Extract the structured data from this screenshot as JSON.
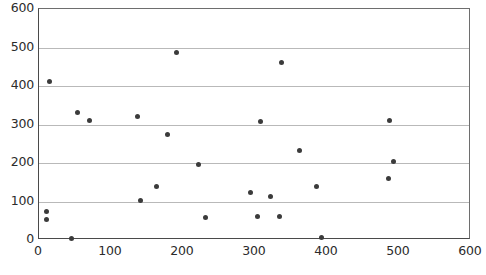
{
  "chart_data": {
    "type": "scatter",
    "title": "",
    "subtitle": "",
    "xlabel": "",
    "ylabel": "",
    "xlim": [
      0,
      600
    ],
    "ylim": [
      0,
      600
    ],
    "xticks": [
      0,
      100,
      200,
      300,
      400,
      500,
      600
    ],
    "yticks": [
      0,
      100,
      200,
      300,
      400,
      500,
      600
    ],
    "grid": "horizontal",
    "legend": "none",
    "marker_color": "#3b3b3b",
    "gridline_color": "#b9b9b9",
    "axis_color": "#4a4a4a",
    "background_color": "#ffffff",
    "series": [
      {
        "name": "series-1",
        "points": [
          {
            "x": 14,
            "y": 412
          },
          {
            "x": 11,
            "y": 75
          },
          {
            "x": 11,
            "y": 52
          },
          {
            "x": 45,
            "y": 5
          },
          {
            "x": 53,
            "y": 330
          },
          {
            "x": 70,
            "y": 310
          },
          {
            "x": 141,
            "y": 102
          },
          {
            "x": 137,
            "y": 322
          },
          {
            "x": 163,
            "y": 140
          },
          {
            "x": 178,
            "y": 273
          },
          {
            "x": 191,
            "y": 487
          },
          {
            "x": 222,
            "y": 196
          },
          {
            "x": 231,
            "y": 59
          },
          {
            "x": 294,
            "y": 123
          },
          {
            "x": 308,
            "y": 308
          },
          {
            "x": 303,
            "y": 62
          },
          {
            "x": 322,
            "y": 114
          },
          {
            "x": 334,
            "y": 62
          },
          {
            "x": 337,
            "y": 461
          },
          {
            "x": 362,
            "y": 232
          },
          {
            "x": 385,
            "y": 140
          },
          {
            "x": 393,
            "y": 7
          },
          {
            "x": 487,
            "y": 311
          },
          {
            "x": 492,
            "y": 203
          },
          {
            "x": 486,
            "y": 159
          }
        ]
      }
    ]
  }
}
